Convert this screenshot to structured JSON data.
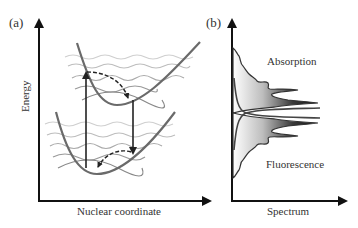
{
  "panels": [
    {
      "id": "a",
      "label": "(a)",
      "xlabel": "Nuclear coordinate",
      "ylabel": "Energy",
      "content": "Two displaced potential energy surfaces (ground and excited) with vibrational wavefunctions; upward absorption arrow, downward emission arrow, dashed relaxation arrows"
    },
    {
      "id": "b",
      "label": "(b)",
      "xlabel": "Spectrum",
      "ylabel": "",
      "annotations": [
        "Absorption",
        "Fluorescence"
      ],
      "content": "Mirror-image absorption and fluorescence vibronic spectra plotted vertically with gradient fill"
    }
  ],
  "colors": {
    "axis": "#111111",
    "curve": "#666666",
    "wave": "#9a9a9a",
    "wave_light": "#c8c8c8",
    "arrow": "#222222",
    "spectrum_dark": "#222222",
    "text": "#333333"
  }
}
